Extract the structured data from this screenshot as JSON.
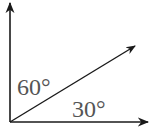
{
  "diagram": {
    "type": "angle-vector-diagram",
    "vertical_axis": {
      "direction": "up",
      "arrowhead": true
    },
    "horizontal_axis": {
      "direction": "right",
      "arrowhead": true
    },
    "vector": {
      "direction": "up-right",
      "arrowhead": true
    },
    "labels": {
      "angle_from_vertical": "60°",
      "angle_from_horizontal": "30°"
    },
    "colors": {
      "line": "#1a1a1a",
      "label": "#555555",
      "background": "#ffffff"
    }
  }
}
